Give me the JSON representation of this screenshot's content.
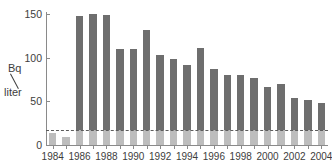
{
  "chart_data": {
    "type": "bar",
    "title": "",
    "subtitle": "",
    "xlabel": "",
    "ylabel": "Bq/liter",
    "ylabel_numerator": "Bq",
    "ylabel_denominator": "liter",
    "categories": [
      "1984",
      "1985",
      "1986",
      "1987",
      "1988",
      "1989",
      "1990",
      "1991",
      "1992",
      "1993",
      "1994",
      "1995",
      "1996",
      "1997",
      "1998",
      "1999",
      "2000",
      "2001",
      "2002",
      "2003",
      "2004"
    ],
    "values": [
      14,
      9,
      148,
      150,
      149,
      110,
      110,
      132,
      103,
      99,
      92,
      111,
      87,
      80,
      80,
      77,
      66,
      70,
      54,
      51,
      48
    ],
    "series": [
      {
        "name": "Bq per liter",
        "values": [
          14,
          9,
          148,
          150,
          149,
          110,
          110,
          132,
          103,
          99,
          92,
          111,
          87,
          80,
          80,
          77,
          66,
          70,
          54,
          51,
          48
        ],
        "color": "#6e6e6e"
      }
    ],
    "baseline_segment": {
      "name": "baseline portion",
      "value": 17,
      "color": "#bdbdbd"
    },
    "reference_line": {
      "value": 17,
      "style": "dashed",
      "color": "#5c5c5c"
    },
    "ylim": [
      0,
      150
    ],
    "yticks": [
      0,
      50,
      100,
      150
    ],
    "ytick_labels": [
      "0",
      "50",
      "100",
      "150"
    ],
    "xticks_labeled": [
      "1984",
      "1986",
      "1988",
      "1990",
      "1992",
      "1994",
      "1996",
      "1998",
      "2000",
      "2002",
      "2004"
    ],
    "grid": false,
    "legend": "none",
    "bar_color": "#6e6e6e",
    "axis_color": "#8a8a8a",
    "background": "#ffffff"
  }
}
